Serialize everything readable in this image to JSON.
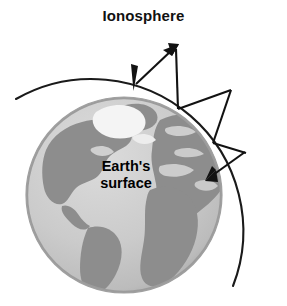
{
  "figure": {
    "title": "Ionosphere",
    "earth_label_line1": "Earth's",
    "earth_label_line2": "surface"
  },
  "colors": {
    "ocean": "#c9c9c9",
    "ocean_light": "#d4d4d4",
    "land": "#8d8d8d",
    "land_dark": "#7e7e7e",
    "ice": "#f2f2f2",
    "outline": "#1a1a1a",
    "background": "#ffffff",
    "shadow": "#b4b4b4"
  },
  "diagram": {
    "type": "skywave-propagation",
    "earth": {
      "center_x": 124,
      "center_y": 195,
      "radius": 98
    },
    "ionosphere_arc": {
      "start_x": 16,
      "start_y": 99,
      "end_x": 233,
      "end_y": 286,
      "radius": 152,
      "description": "curved arc representing the ionosphere layer above Earth"
    },
    "ray_path": {
      "description": "radio signal zig-zagging between Earth's surface and the ionosphere",
      "segments": [
        {
          "from_x": 133,
          "from_y": 87,
          "to_x": 176,
          "to_y": 47,
          "arrow": "end",
          "label": "upward ray to ionosphere"
        },
        {
          "from_x": 176,
          "from_y": 47,
          "to_x": 178,
          "to_y": 108,
          "arrow": "none",
          "label": "reflected ray to surface"
        },
        {
          "from_x": 178,
          "from_y": 108,
          "to_x": 230,
          "to_y": 90,
          "arrow": "none",
          "label": "upward ray to ionosphere"
        },
        {
          "from_x": 230,
          "from_y": 90,
          "to_x": 213,
          "to_y": 143,
          "arrow": "none",
          "label": "reflected ray to surface"
        },
        {
          "from_x": 213,
          "from_y": 143,
          "to_x": 245,
          "to_y": 152,
          "arrow": "none",
          "label": "upward ray to ionosphere"
        },
        {
          "from_x": 245,
          "from_y": 152,
          "to_x": 208,
          "to_y": 178,
          "arrow": "end",
          "label": "final ray back to surface"
        }
      ],
      "arrowheads": [
        {
          "x": 133,
          "y": 87,
          "direction": "down",
          "label": "ray striking Earth's surface"
        },
        {
          "x": 176,
          "y": 47,
          "direction": "up-right",
          "label": "ray striking ionosphere"
        },
        {
          "x": 208,
          "y": 178,
          "direction": "down-left",
          "label": "ray returning to Earth's surface"
        }
      ]
    }
  }
}
